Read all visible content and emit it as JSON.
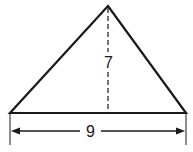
{
  "diagram": {
    "shape": "triangle",
    "height_label": "7",
    "base_label": "9",
    "colors": {
      "stroke": "#1a1a1a",
      "background": "#ffffff"
    }
  }
}
